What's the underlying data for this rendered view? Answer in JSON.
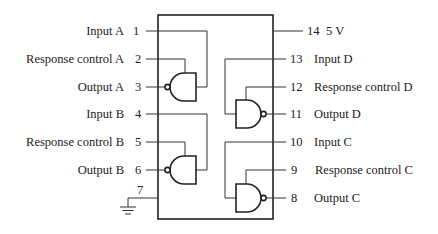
{
  "chip": {
    "left_pins": [
      {
        "number": "1",
        "label": "Input A"
      },
      {
        "number": "2",
        "label": "Response control A"
      },
      {
        "number": "3",
        "label": "Output A"
      },
      {
        "number": "4",
        "label": "Input B"
      },
      {
        "number": "5",
        "label": "Response control B"
      },
      {
        "number": "6",
        "label": "Output B"
      },
      {
        "number": "7",
        "label": ""
      }
    ],
    "right_pins": [
      {
        "number": "14",
        "label": "5 V"
      },
      {
        "number": "13",
        "label": "Input D"
      },
      {
        "number": "12",
        "label": "Response control D"
      },
      {
        "number": "11",
        "label": "Output D"
      },
      {
        "number": "10",
        "label": "Input C"
      },
      {
        "number": "9",
        "label": "Response control C"
      },
      {
        "number": "8",
        "label": "Output C"
      }
    ],
    "gates": [
      "A",
      "B",
      "C",
      "D"
    ],
    "gate_type": "NAND",
    "ground_pin": "7",
    "power_pin": "14"
  }
}
